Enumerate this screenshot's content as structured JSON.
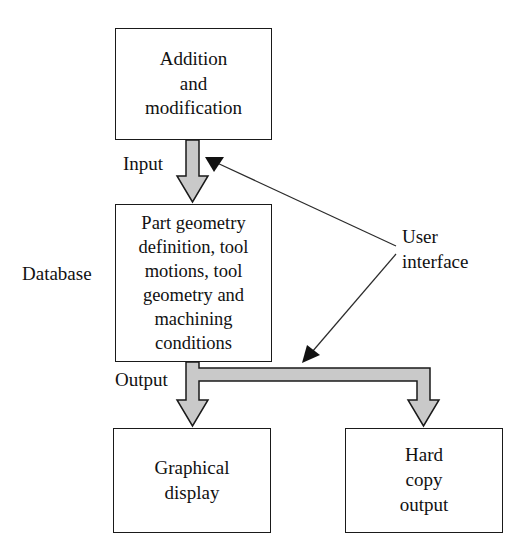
{
  "diagram": {
    "colors": {
      "box_border": "#1a1a1a",
      "box_fill": "#ffffff",
      "block_arrow_fill": "#c9c9c9",
      "block_arrow_stroke": "#1a1a1a",
      "thin_line": "#2b2b2b",
      "text": "#111111",
      "background": "#ffffff"
    },
    "nodes": [
      {
        "id": "addition",
        "label": "Addition\nand\nmodification"
      },
      {
        "id": "database",
        "label": "Part geometry\ndefinition, tool\nmotions, tool\ngeometry and\nmachining\nconditions"
      },
      {
        "id": "graphical_display",
        "label": "Graphical\ndisplay"
      },
      {
        "id": "hard_copy_output",
        "label": "Hard\ncopy\noutput"
      }
    ],
    "labels": {
      "input": "Input",
      "output": "Output",
      "database": "Database",
      "user_interface": "User\ninterface"
    },
    "edges": [
      {
        "id": "input-arrow",
        "style": "block-arrow",
        "from": "addition",
        "to": "database",
        "annotation": "Input"
      },
      {
        "id": "output-arrow-left",
        "style": "block-arrow",
        "from": "database",
        "to": "graphical_display",
        "annotation": "Output"
      },
      {
        "id": "output-arrow-right",
        "style": "block-arrow",
        "from": "database",
        "to": "hard_copy_output",
        "annotation": "Output"
      },
      {
        "id": "user-interface-to-input",
        "style": "thin-line",
        "from": "user_interface",
        "to": "input-arrow",
        "annotation": "User interface"
      },
      {
        "id": "user-interface-to-output",
        "style": "thin-line",
        "from": "user_interface",
        "to": "output-arrow",
        "annotation": "User interface"
      }
    ]
  }
}
